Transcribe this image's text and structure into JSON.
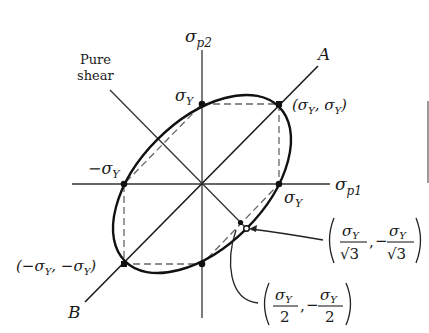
{
  "diagram": {
    "type": "yield-criteria-plot",
    "axes": {
      "horizontal": {
        "label_base": "σ",
        "label_sub": "p1"
      },
      "vertical": {
        "label_base": "σ",
        "label_sub": "p2"
      }
    },
    "diagonal_lines": {
      "A": "A",
      "B": "B",
      "pure_shear_line1": "Pure",
      "pure_shear_line2": "shear"
    },
    "point_labels": {
      "sigma_y_top": {
        "base": "σ",
        "sub": "Y"
      },
      "sigma_y_right": {
        "base": "σ",
        "sub": "Y"
      },
      "neg_sigma_y_left": {
        "prefix": "−σ",
        "sub": "Y"
      },
      "corner_top_right": {
        "text": "(σ",
        "sub1": "Y",
        "mid": ", σ",
        "sub2": "Y",
        "end": ")"
      },
      "corner_bottom_left": {
        "text": "(−σ",
        "sub1": "Y",
        "mid": ", −σ",
        "sub2": "Y",
        "end": ")"
      }
    },
    "callouts": {
      "von_mises_point": {
        "num_base": "σ",
        "num_sub": "Y",
        "den": "√3",
        "separator": ",",
        "neg": "−"
      },
      "tresca_point": {
        "num_base": "σ",
        "num_sub": "Y",
        "den": "2",
        "separator": ",",
        "neg": "−"
      }
    },
    "shapes": {
      "ellipse": "von Mises (solid)",
      "hexagon": "Tresca (dashed)"
    }
  }
}
